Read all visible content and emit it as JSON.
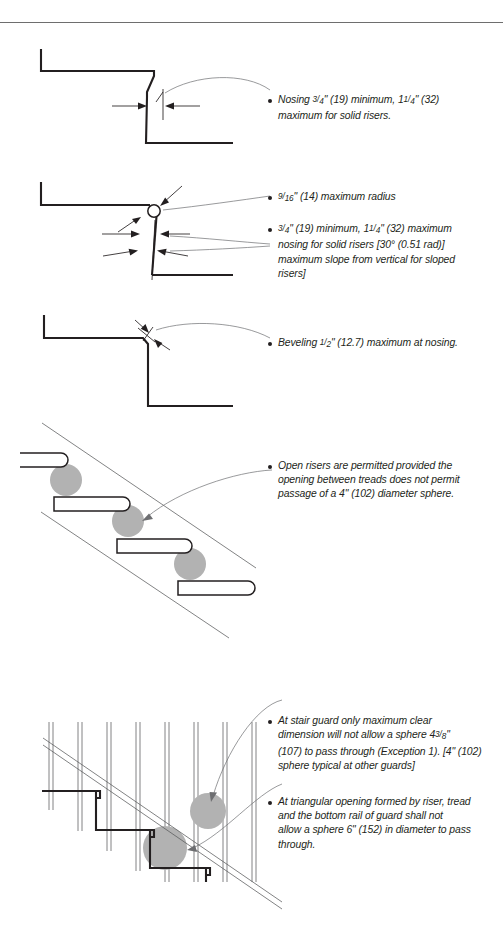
{
  "page": {
    "width": 503,
    "height": 946,
    "background_color": "#ffffff",
    "ink_color": "#231f20",
    "sphere_color": "#b2b2b2",
    "rule_color": "#6e6e6e"
  },
  "figures": [
    {
      "id": "fig-nosing-solid-riser",
      "name": "Nosing projection on solid riser",
      "notes": [
        {
          "id": "note-nosing",
          "lines": [
            "Nosing 3/4\" (19) minimum, 1 1/4\" (32)",
            "maximum for solid risers."
          ]
        }
      ]
    },
    {
      "id": "fig-radius-sloped-riser",
      "name": "Nosing radius and sloped riser",
      "notes": [
        {
          "id": "note-radius",
          "lines": [
            "9/16\" (14) maximum radius"
          ]
        },
        {
          "id": "note-sloped-riser",
          "lines": [
            "3/4\" (19) minimum, 1 1/4\" (32) maximum",
            "nosing for solid risers [30° (0.51 rad)]",
            "maximum slope from vertical for sloped",
            "risers]"
          ]
        }
      ]
    },
    {
      "id": "fig-beveling",
      "name": "Beveled nosing",
      "notes": [
        {
          "id": "note-beveling",
          "lines": [
            "Beveling 1/2\" (12.7) maximum at nosing."
          ]
        }
      ]
    },
    {
      "id": "fig-open-risers",
      "name": "Open risers with 4 inch sphere",
      "notes": [
        {
          "id": "note-open-risers",
          "lines": [
            "Open risers are permitted provided the",
            "opening between treads does not permit",
            "passage of a 4\" (102) diameter sphere."
          ]
        }
      ]
    },
    {
      "id": "fig-guard-openings",
      "name": "Stair guard sphere openings",
      "notes": [
        {
          "id": "note-stair-guard",
          "lines": [
            "At stair guard only maximum clear",
            "dimension will not allow a sphere 4 3/8\"",
            "(107) to pass through (Exception 1). [4\" (102)",
            "sphere typical at other guards]"
          ]
        },
        {
          "id": "note-triangular-opening",
          "lines": [
            "At triangular opening formed by riser, tread",
            "and the bottom rail of guard shall not",
            "allow a sphere 6\" (152) in diameter to pass",
            "through."
          ]
        }
      ]
    }
  ],
  "note_text": {
    "nosing_l1_a": "Nosing ",
    "nosing_num1": "3",
    "nosing_den1": "4",
    "nosing_l1_b": "\" (19) minimum, 1",
    "nosing_num2": "1",
    "nosing_den2": "4",
    "nosing_l1_c": "\" (32)",
    "nosing_l2": "maximum for solid risers.",
    "radius_num": "9",
    "radius_den": "16",
    "radius_rest": "\" (14) maximum radius",
    "sloped_num1": "3",
    "sloped_den1": "4",
    "sloped_l1_a": "\" (19) minimum, 1",
    "sloped_num2": "1",
    "sloped_den2": "4",
    "sloped_l1_b": "\" (32) maximum",
    "sloped_l2": "nosing for solid risers [30° (0.51 rad)]",
    "sloped_l3": "maximum slope from vertical for sloped",
    "sloped_l4": "risers]",
    "bevel_a": "Beveling ",
    "bevel_num": "1",
    "bevel_den": "2",
    "bevel_b": "\" (12.7) maximum at nosing.",
    "open_l1": "Open risers are permitted provided the",
    "open_l2": "opening between treads does not permit",
    "open_l3": "passage of a 4\" (102) diameter sphere.",
    "guard_l1": "At stair guard only maximum clear",
    "guard_l2_a": "dimension will not allow a sphere 4",
    "guard_num": "3",
    "guard_den": "8",
    "guard_l2_b": "\"",
    "guard_l3": "(107) to pass through (Exception 1). [4\" (102)",
    "guard_l4": "sphere typical at other guards]",
    "tri_l1": "At triangular opening formed by riser, tread",
    "tri_l2": "and the bottom rail of guard shall not",
    "tri_l3": "allow a sphere 6\" (152) in diameter to pass",
    "tri_l4": "through."
  }
}
